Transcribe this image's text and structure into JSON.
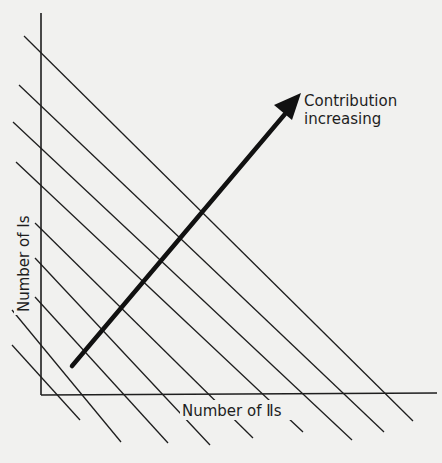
{
  "diagram": {
    "x_axis_label": "Number of Ⅱs",
    "y_axis_label": "Number of Is",
    "arrow_label_line1": "Contribution",
    "arrow_label_line2": "increasing",
    "colors": {
      "background": "#f1f1ef",
      "ink": "#1e1e1e"
    },
    "iso_lines_count": 9
  }
}
